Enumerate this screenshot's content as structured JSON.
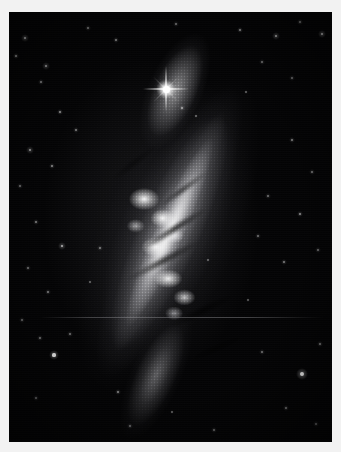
{
  "image": {
    "kind": "astronomical-photograph",
    "subject": "edge-on starburst galaxy",
    "color_mode": "grayscale",
    "background_color": "#040405",
    "border_color": "#f2f2f2",
    "plate": {
      "left": 9,
      "top": 12,
      "width": 323,
      "height": 430
    },
    "canvas": {
      "width": 341,
      "height": 452
    }
  },
  "galaxy": {
    "name": "",
    "position_angle_deg": 24,
    "center": {
      "x": 155,
      "y": 232
    },
    "major_axis_px": 360,
    "minor_axis_px": 150,
    "features": [
      {
        "name": "northwest-diffuse-plume",
        "x": 96,
        "y": 96
      },
      {
        "name": "bright-knotty-core",
        "x": 152,
        "y": 212
      },
      {
        "name": "secondary-knot-cluster",
        "x": 172,
        "y": 284
      },
      {
        "name": "southeast-fading-tail",
        "x": 228,
        "y": 382
      }
    ],
    "dust_lanes": [
      {
        "x": 168,
        "y": 220,
        "angle_deg": -32
      },
      {
        "x": 156,
        "y": 253,
        "angle_deg": -28
      },
      {
        "x": 176,
        "y": 181,
        "angle_deg": -36
      },
      {
        "x": 196,
        "y": 302,
        "angle_deg": -26
      },
      {
        "x": 127,
        "y": 155,
        "angle_deg": -38
      },
      {
        "x": 210,
        "y": 340,
        "angle_deg": -24
      }
    ]
  },
  "bright_star": {
    "label": "foreground-star-with-diffraction-spikes",
    "x": 166,
    "y": 89,
    "core_px": 7,
    "spike_length_px": 46
  },
  "artifacts": [
    {
      "name": "horizontal-scan-line",
      "y": 317,
      "x_start": 40,
      "x_end": 323
    }
  ],
  "field_stars": [
    {
      "x": 25,
      "y": 38,
      "r": 1.3,
      "o": 0.72
    },
    {
      "x": 16,
      "y": 56,
      "r": 1.0,
      "o": 0.55
    },
    {
      "x": 46,
      "y": 66,
      "r": 1.1,
      "o": 0.6
    },
    {
      "x": 41,
      "y": 82,
      "r": 0.9,
      "o": 0.45
    },
    {
      "x": 88,
      "y": 28,
      "r": 0.8,
      "o": 0.4
    },
    {
      "x": 116,
      "y": 40,
      "r": 0.9,
      "o": 0.46
    },
    {
      "x": 176,
      "y": 24,
      "r": 0.8,
      "o": 0.38
    },
    {
      "x": 240,
      "y": 30,
      "r": 1.0,
      "o": 0.52
    },
    {
      "x": 276,
      "y": 36,
      "r": 1.2,
      "o": 0.66
    },
    {
      "x": 300,
      "y": 22,
      "r": 0.9,
      "o": 0.44
    },
    {
      "x": 322,
      "y": 34,
      "r": 1.4,
      "o": 0.78
    },
    {
      "x": 262,
      "y": 62,
      "r": 0.8,
      "o": 0.36
    },
    {
      "x": 292,
      "y": 78,
      "r": 0.8,
      "o": 0.34
    },
    {
      "x": 246,
      "y": 92,
      "r": 0.7,
      "o": 0.3
    },
    {
      "x": 182,
      "y": 108,
      "r": 1.0,
      "o": 0.5
    },
    {
      "x": 196,
      "y": 116,
      "r": 0.7,
      "o": 0.32
    },
    {
      "x": 60,
      "y": 112,
      "r": 1.0,
      "o": 0.52
    },
    {
      "x": 76,
      "y": 130,
      "r": 0.8,
      "o": 0.38
    },
    {
      "x": 30,
      "y": 150,
      "r": 1.1,
      "o": 0.58
    },
    {
      "x": 52,
      "y": 166,
      "r": 0.9,
      "o": 0.44
    },
    {
      "x": 20,
      "y": 186,
      "r": 0.8,
      "o": 0.36
    },
    {
      "x": 292,
      "y": 140,
      "r": 0.9,
      "o": 0.42
    },
    {
      "x": 312,
      "y": 172,
      "r": 0.8,
      "o": 0.36
    },
    {
      "x": 268,
      "y": 196,
      "r": 0.8,
      "o": 0.34
    },
    {
      "x": 300,
      "y": 214,
      "r": 1.0,
      "o": 0.48
    },
    {
      "x": 258,
      "y": 236,
      "r": 0.8,
      "o": 0.34
    },
    {
      "x": 284,
      "y": 262,
      "r": 0.9,
      "o": 0.4
    },
    {
      "x": 318,
      "y": 250,
      "r": 0.8,
      "o": 0.34
    },
    {
      "x": 36,
      "y": 222,
      "r": 0.9,
      "o": 0.42
    },
    {
      "x": 62,
      "y": 246,
      "r": 1.2,
      "o": 0.62
    },
    {
      "x": 28,
      "y": 268,
      "r": 0.8,
      "o": 0.36
    },
    {
      "x": 48,
      "y": 292,
      "r": 0.9,
      "o": 0.4
    },
    {
      "x": 90,
      "y": 282,
      "r": 0.7,
      "o": 0.3
    },
    {
      "x": 100,
      "y": 248,
      "r": 0.9,
      "o": 0.4
    },
    {
      "x": 22,
      "y": 320,
      "r": 0.8,
      "o": 0.34
    },
    {
      "x": 54,
      "y": 355,
      "r": 1.6,
      "o": 0.88
    },
    {
      "x": 40,
      "y": 338,
      "r": 0.9,
      "o": 0.4
    },
    {
      "x": 70,
      "y": 334,
      "r": 0.8,
      "o": 0.34
    },
    {
      "x": 36,
      "y": 398,
      "r": 0.8,
      "o": 0.34
    },
    {
      "x": 118,
      "y": 392,
      "r": 1.0,
      "o": 0.46
    },
    {
      "x": 130,
      "y": 426,
      "r": 0.8,
      "o": 0.34
    },
    {
      "x": 172,
      "y": 412,
      "r": 0.7,
      "o": 0.3
    },
    {
      "x": 214,
      "y": 430,
      "r": 0.8,
      "o": 0.32
    },
    {
      "x": 262,
      "y": 352,
      "r": 0.8,
      "o": 0.34
    },
    {
      "x": 302,
      "y": 374,
      "r": 2.0,
      "o": 0.95
    },
    {
      "x": 320,
      "y": 344,
      "r": 0.9,
      "o": 0.42
    },
    {
      "x": 286,
      "y": 408,
      "r": 0.9,
      "o": 0.4
    },
    {
      "x": 316,
      "y": 424,
      "r": 0.8,
      "o": 0.34
    },
    {
      "x": 248,
      "y": 300,
      "r": 0.7,
      "o": 0.28
    },
    {
      "x": 208,
      "y": 260,
      "r": 0.7,
      "o": 0.3
    }
  ]
}
